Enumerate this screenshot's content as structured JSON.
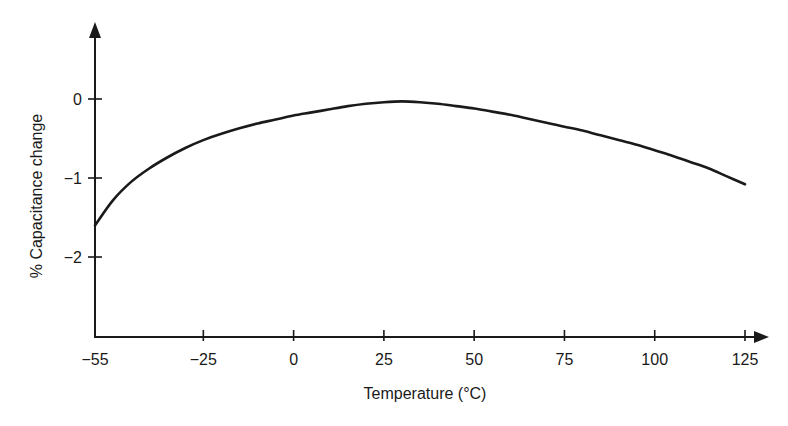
{
  "chart_data": {
    "type": "line",
    "title": "",
    "xlabel": "Temperature (°C)",
    "ylabel": "% Capacitance change",
    "x_ticks": [
      -55,
      -25,
      0,
      25,
      50,
      75,
      100,
      125
    ],
    "x_tick_labels": [
      "−55",
      "−25",
      "0",
      "25",
      "50",
      "75",
      "100",
      "125"
    ],
    "y_ticks": [
      0,
      -1,
      -2
    ],
    "y_tick_labels": [
      "0",
      "−1",
      "−2"
    ],
    "xlim": [
      -55,
      127
    ],
    "ylim": [
      -3.0,
      1.0
    ],
    "grid": false,
    "legend": null,
    "series": [
      {
        "name": "Capacitance change",
        "color": "#1a1a1a",
        "x": [
          -55,
          -50,
          -45,
          -40,
          -35,
          -30,
          -25,
          -20,
          -15,
          -10,
          -5,
          0,
          5,
          10,
          15,
          20,
          25,
          30,
          35,
          40,
          45,
          50,
          55,
          60,
          65,
          70,
          75,
          80,
          85,
          90,
          95,
          100,
          105,
          110,
          115,
          120,
          125
        ],
        "y": [
          -1.6,
          -1.28,
          -1.05,
          -0.88,
          -0.74,
          -0.62,
          -0.52,
          -0.44,
          -0.37,
          -0.31,
          -0.26,
          -0.21,
          -0.17,
          -0.13,
          -0.09,
          -0.06,
          -0.04,
          -0.03,
          -0.04,
          -0.06,
          -0.09,
          -0.12,
          -0.16,
          -0.2,
          -0.25,
          -0.3,
          -0.35,
          -0.4,
          -0.46,
          -0.52,
          -0.58,
          -0.65,
          -0.72,
          -0.8,
          -0.88,
          -0.98,
          -1.08
        ]
      }
    ]
  }
}
